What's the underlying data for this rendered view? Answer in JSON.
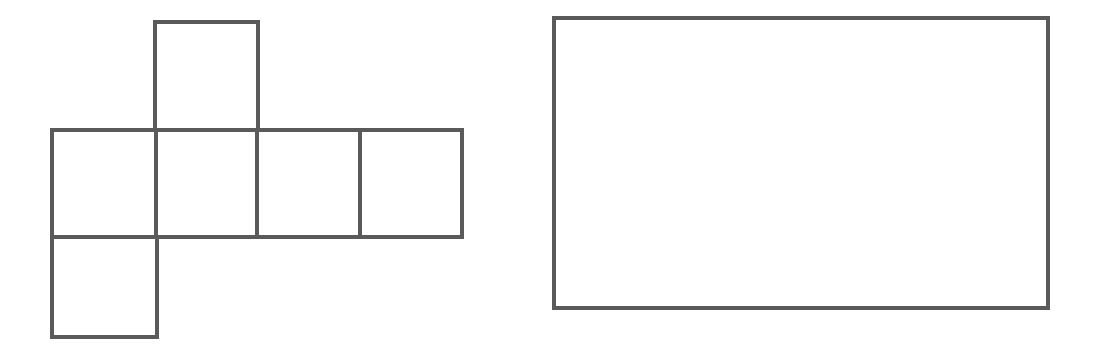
{
  "page": {
    "background_color": "#ffffff",
    "width": 1100,
    "height": 353
  },
  "style": {
    "stroke_color": "#5a5a5a",
    "stroke_width": 4,
    "fill_color": "none"
  },
  "figures": [
    {
      "id": "cube-net",
      "name": "cube-net-figure",
      "label": "",
      "description": "Net of a cube: four squares in a horizontal row, one square above the second square, one square below the first square",
      "square_size": 104,
      "bounds": {
        "x": 52,
        "y": 22,
        "width": 410,
        "height": 315
      },
      "cells": [
        {
          "name": "net-square-top",
          "x": 155,
          "y": 22,
          "width": 103,
          "height": 108
        },
        {
          "name": "net-square-row-1",
          "x": 52,
          "y": 130,
          "width": 104,
          "height": 107
        },
        {
          "name": "net-square-row-2",
          "x": 156,
          "y": 130,
          "width": 101,
          "height": 107
        },
        {
          "name": "net-square-row-3",
          "x": 257,
          "y": 130,
          "width": 103,
          "height": 107
        },
        {
          "name": "net-square-row-4",
          "x": 360,
          "y": 130,
          "width": 102,
          "height": 107
        },
        {
          "name": "net-square-bottom",
          "x": 52,
          "y": 237,
          "width": 105,
          "height": 100
        }
      ],
      "outline_path": "M 155 22 L 258 22 L 258 130 L 462 130 L 462 237 L 157 237 L 157 337 L 52 337 L 52 130 L 155 130 Z",
      "interior_lines": [
        {
          "name": "net-divider-vertical-1",
          "x1": 156,
          "y1": 130,
          "x2": 156,
          "y2": 237
        },
        {
          "name": "net-divider-vertical-2",
          "x1": 257,
          "y1": 130,
          "x2": 257,
          "y2": 237
        },
        {
          "name": "net-divider-vertical-3",
          "x1": 360,
          "y1": 130,
          "x2": 360,
          "y2": 237
        },
        {
          "name": "net-divider-horizontal-top",
          "x1": 155,
          "y1": 130,
          "x2": 258,
          "y2": 130
        },
        {
          "name": "net-divider-horizontal-bottom",
          "x1": 52,
          "y1": 237,
          "x2": 157,
          "y2": 237
        }
      ]
    },
    {
      "id": "rectangle",
      "name": "rectangle-figure",
      "label": "",
      "description": "Empty rectangle outline",
      "bounds": {
        "x": 554,
        "y": 18,
        "width": 494,
        "height": 290
      }
    }
  ]
}
